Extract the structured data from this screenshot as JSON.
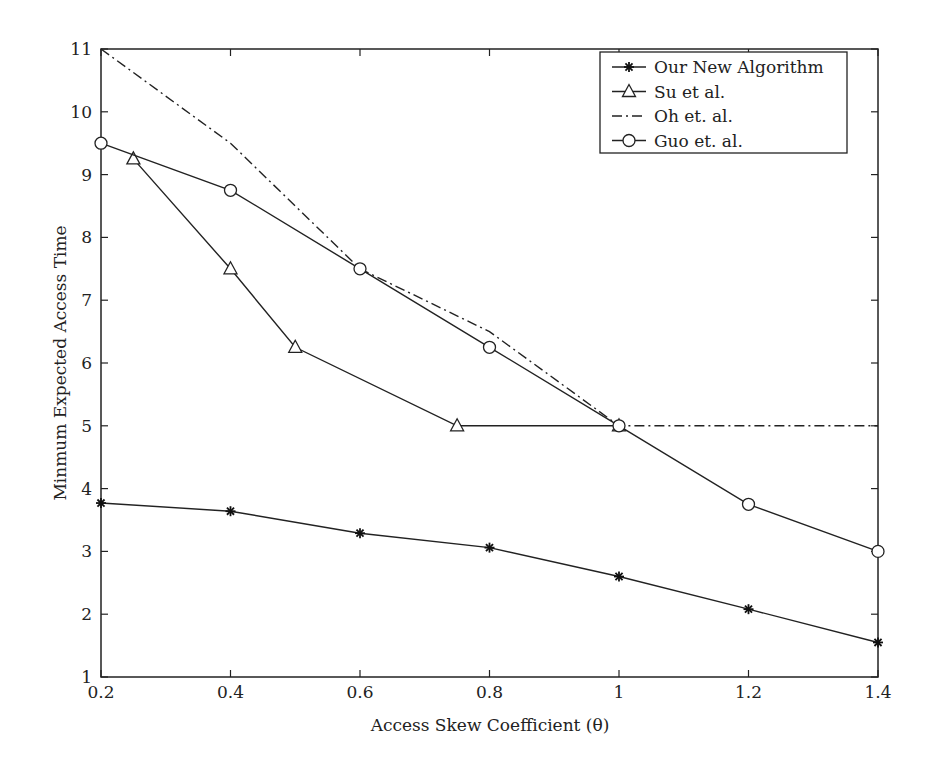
{
  "chart_data": {
    "type": "line",
    "title": "",
    "xlabel": "Access Skew Coefficient (θ)",
    "ylabel": "Minmum Expected Access Time",
    "xlim": [
      0.2,
      1.4
    ],
    "ylim": [
      1,
      11
    ],
    "xticks": [
      "0.2",
      "0.4",
      "0.6",
      "0.8",
      "1",
      "1.2",
      "1.4"
    ],
    "yticks": [
      "1",
      "2",
      "3",
      "4",
      "5",
      "6",
      "7",
      "8",
      "9",
      "10",
      "11"
    ],
    "grid": false,
    "legend_position": "upper right",
    "series": [
      {
        "name": "Our New Algorithm",
        "marker": "asterisk",
        "style": "solid",
        "x": [
          0.2,
          0.4,
          0.6,
          0.8,
          1.0,
          1.2,
          1.4
        ],
        "y": [
          3.77,
          3.64,
          3.29,
          3.06,
          2.6,
          2.08,
          1.55
        ]
      },
      {
        "name": "Su et al.",
        "marker": "triangle",
        "style": "solid",
        "x": [
          0.25,
          0.4,
          0.5,
          0.75,
          1.0
        ],
        "y": [
          9.25,
          7.5,
          6.25,
          5.0,
          5.0
        ]
      },
      {
        "name": "Oh et. al.",
        "marker": "none",
        "style": "dashdot",
        "x": [
          0.2,
          0.4,
          0.6,
          0.8,
          1.0,
          1.4
        ],
        "y": [
          11.0,
          9.5,
          7.5,
          6.5,
          5.0,
          5.0
        ]
      },
      {
        "name": "Guo et. al.",
        "marker": "circle",
        "style": "solid",
        "x": [
          0.2,
          0.4,
          0.6,
          0.8,
          1.0,
          1.2,
          1.4
        ],
        "y": [
          9.5,
          8.75,
          7.5,
          6.25,
          5.0,
          3.75,
          3.0
        ]
      }
    ]
  }
}
